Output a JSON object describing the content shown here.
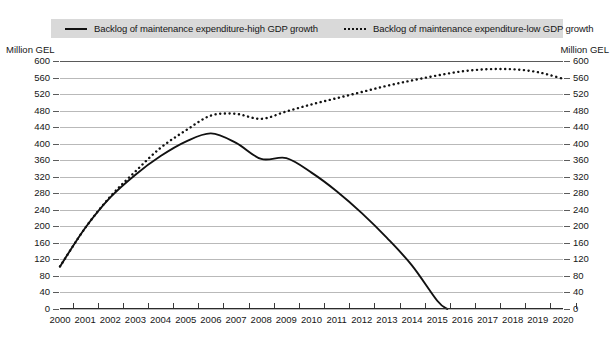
{
  "legend": {
    "entries": [
      {
        "label": "Backlog of maintenance expenditure-high GDP growth",
        "style": "solid",
        "icon": "solid-line-swatch"
      },
      {
        "label": "Backlog of maintenance expenditure-low GDP growth",
        "style": "dotted",
        "icon": "dotted-line-swatch"
      }
    ]
  },
  "axis_caption_left": "Million GEL",
  "axis_caption_right": "Million GEL",
  "chart_data": {
    "type": "line",
    "title": "",
    "subtitle": "",
    "xlabel": "",
    "ylabel": "Million GEL",
    "ylabel_right": "Million GEL",
    "ylim": [
      0,
      600
    ],
    "ytick_step": 40,
    "yticks": [
      0,
      40,
      80,
      120,
      160,
      200,
      240,
      280,
      320,
      360,
      400,
      440,
      480,
      520,
      560,
      600
    ],
    "xlim": [
      2000,
      2020
    ],
    "grid": true,
    "grid_axis": "y",
    "legend_position": "top",
    "categories": [
      "2000",
      "2001",
      "2002",
      "2003",
      "2004",
      "2005",
      "2006",
      "2007",
      "2008",
      "2009",
      "2010",
      "2011",
      "2012",
      "2013",
      "2014",
      "2015",
      "2016",
      "2017",
      "2018",
      "2019",
      "2020"
    ],
    "x": [
      2000,
      2001,
      2002,
      2003,
      2004,
      2005,
      2006,
      2007,
      2008,
      2009,
      2010,
      2011,
      2012,
      2013,
      2014,
      2015,
      2016,
      2017,
      2018,
      2019,
      2020
    ],
    "series": [
      {
        "name": "Backlog of maintenance expenditure-high GDP growth",
        "style": "solid",
        "color": "#111111",
        "values": [
          103,
          196,
          270,
          325,
          370,
          405,
          425,
          402,
          363,
          365,
          330,
          285,
          232,
          172,
          105,
          20,
          null,
          null,
          null,
          null,
          null
        ],
        "zero_crossing_x": 2015.4,
        "note": "Line ends at the x-axis (0) in 2015; no data plotted afterwards."
      },
      {
        "name": "Backlog of maintenance expenditure-low GDP growth",
        "style": "dotted",
        "color": "#111111",
        "values": [
          103,
          196,
          272,
          333,
          390,
          432,
          468,
          472,
          460,
          478,
          495,
          510,
          525,
          540,
          553,
          565,
          575,
          580,
          580,
          573,
          557
        ]
      }
    ]
  }
}
